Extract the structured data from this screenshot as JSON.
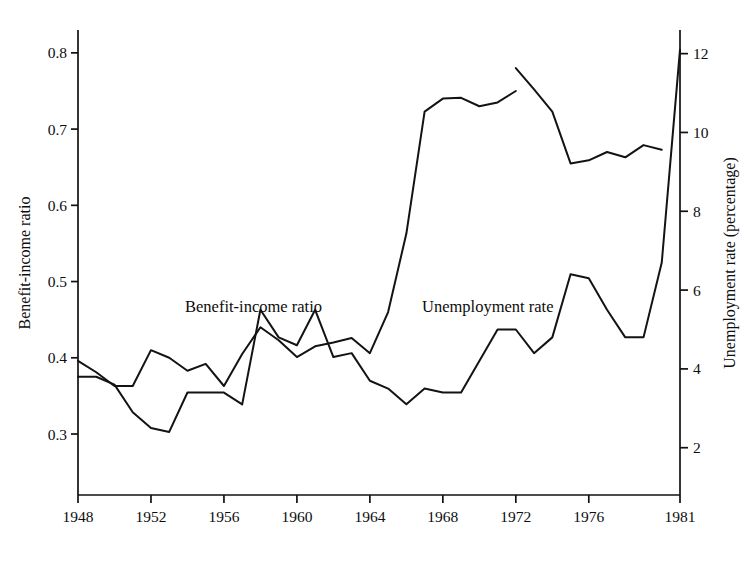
{
  "figure": {
    "left_axis_title": "Benefit-income ratio",
    "right_axis_title": "Unemployment rate (percentage)",
    "inline_label_left": "Benefit-income ratio",
    "inline_label_right": "Unemployment rate",
    "line_color": "#131313",
    "axis_color": "#111111",
    "background": "#ffffff"
  },
  "chart_data": {
    "type": "line",
    "title": "",
    "xlabel": "",
    "ylabel": "Benefit-income ratio",
    "y2label": "Unemployment rate (percentage)",
    "grid": false,
    "legend": "inline annotations on curves",
    "xlim": [
      1948,
      1981
    ],
    "ylim": [
      0.22,
      0.83
    ],
    "y2lim": [
      0.8,
      12.6
    ],
    "xticks": [
      1948,
      1952,
      1956,
      1960,
      1964,
      1968,
      1972,
      1976,
      1981
    ],
    "xtick_labels": [
      "1948",
      "1952",
      "1956",
      "1960",
      "1964",
      "1968",
      "1972",
      "1976",
      "1981"
    ],
    "yticks": [
      0.3,
      0.4,
      0.5,
      0.6,
      0.7,
      0.8
    ],
    "ytick_labels": [
      "0.3",
      "0.4",
      "0.5",
      "0.6",
      "0.7",
      "0.8"
    ],
    "y2ticks": [
      2,
      4,
      6,
      8,
      10,
      12
    ],
    "y2tick_labels": [
      "2",
      "4",
      "6",
      "8",
      "10",
      "12"
    ],
    "series": [
      {
        "name": "Benefit-income ratio",
        "axis": "left",
        "note": "series is broken into two segments; a gap occurs at 1972-1973",
        "segments": [
          {
            "x": [
              1948,
              1949,
              1950,
              1951,
              1952,
              1953,
              1954,
              1955,
              1956,
              1957,
              1958,
              1959,
              1960,
              1961,
              1962,
              1963,
              1964,
              1965,
              1966,
              1967,
              1968,
              1969,
              1970,
              1971,
              1972
            ],
            "y": [
              0.396,
              0.381,
              0.363,
              0.363,
              0.41,
              0.4,
              0.383,
              0.392,
              0.363,
              0.405,
              0.44,
              0.423,
              0.401,
              0.415,
              0.42,
              0.426,
              0.406,
              0.46,
              0.563,
              0.723,
              0.74,
              0.741,
              0.73,
              0.735,
              0.75
            ]
          },
          {
            "x": [
              1972,
              1973,
              1974,
              1975,
              1976,
              1977,
              1978,
              1979,
              1980
            ],
            "y": [
              0.78,
              0.752,
              0.723,
              0.655,
              0.659,
              0.67,
              0.663,
              0.679,
              0.673
            ]
          }
        ]
      },
      {
        "name": "Unemployment rate",
        "axis": "right",
        "x": [
          1948,
          1949,
          1950,
          1951,
          1952,
          1953,
          1954,
          1955,
          1956,
          1957,
          1958,
          1959,
          1960,
          1961,
          1962,
          1963,
          1964,
          1965,
          1966,
          1967,
          1968,
          1969,
          1970,
          1971,
          1972,
          1973,
          1974,
          1975,
          1976,
          1977,
          1978,
          1979,
          1980,
          1981
        ],
        "y": [
          3.8,
          3.8,
          3.6,
          2.9,
          2.5,
          2.4,
          3.4,
          3.4,
          3.4,
          3.1,
          5.5,
          4.8,
          4.6,
          5.5,
          4.3,
          4.4,
          3.7,
          3.5,
          3.1,
          3.5,
          3.4,
          3.4,
          4.2,
          5.0,
          5.0,
          4.4,
          4.8,
          6.4,
          6.3,
          5.5,
          4.8,
          4.8,
          6.7,
          12.1
        ]
      }
    ]
  }
}
